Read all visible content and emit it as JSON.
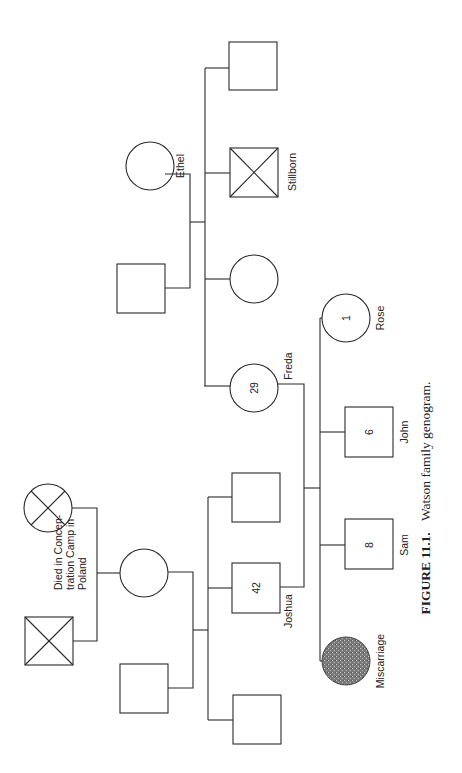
{
  "figure": {
    "caption_label": "FIGURE 11.1.",
    "caption_text": "Watson family genogram.",
    "orientation": "rotated 90° counter-clockwise"
  },
  "people": {
    "grandfather": {
      "type": "male",
      "status": "deceased"
    },
    "grandmother": {
      "type": "female",
      "status": "deceased",
      "note": "Died in Concen-tration Camp in Poland"
    },
    "joshua_mother": {
      "type": "female"
    },
    "joshua_father": {
      "type": "male"
    },
    "joshua": {
      "type": "male",
      "name": "Joshua",
      "age": "42"
    },
    "joshua_sibling_1": {
      "type": "male"
    },
    "joshua_sibling_2": {
      "type": "male"
    },
    "ethel": {
      "type": "female",
      "name": "Ethel"
    },
    "ethel_husband": {
      "type": "male"
    },
    "freda": {
      "type": "female",
      "name": "Freda",
      "age": "29"
    },
    "freda_sister": {
      "type": "female"
    },
    "stillborn": {
      "type": "male",
      "status": "deceased",
      "name": "Stillborn"
    },
    "freda_brother": {
      "type": "male"
    },
    "rose": {
      "type": "female",
      "name": "Rose",
      "age": "1"
    },
    "john": {
      "type": "male",
      "name": "John",
      "age": "6"
    },
    "sam": {
      "type": "male",
      "name": "Sam",
      "age": "8"
    },
    "miscarriage": {
      "type": "pregnancy-loss",
      "name": "Miscarriage"
    }
  },
  "notes": {
    "camp_line1": "Died in Concen-",
    "camp_line2": "tration Camp in",
    "camp_line3": "Poland"
  }
}
